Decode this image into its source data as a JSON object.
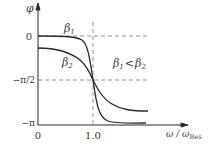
{
  "diagram": {
    "y_axis_label": "φ",
    "x_axis_label_main": "ω / ω",
    "x_axis_label_sub": "Res",
    "y_ticks": [
      {
        "label": "0",
        "value": "0"
      },
      {
        "label": "−π/2",
        "value": "-pi/2"
      },
      {
        "label": "−π",
        "value": "-pi"
      }
    ],
    "x_ticks": [
      {
        "label": "0",
        "value": 0
      },
      {
        "label": "1.0",
        "value": 1.0
      }
    ],
    "curves": [
      {
        "name": "β1",
        "label_base": "β",
        "label_sub": "1",
        "description": "sharp phase transition (smaller damping)"
      },
      {
        "name": "β2",
        "label_base": "β",
        "label_sub": "2",
        "description": "gradual phase transition (larger damping)"
      }
    ],
    "relation": {
      "left_base": "β",
      "left_sub": "1",
      "operator": "<",
      "right_base": "β",
      "right_sub": "2"
    },
    "colors": {
      "line": "#2a2a2a",
      "dash": "#777777",
      "text": "#3a3a3a"
    }
  }
}
